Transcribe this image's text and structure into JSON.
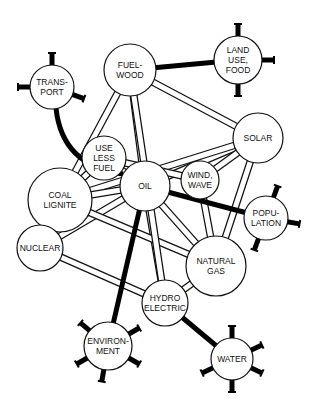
{
  "diagram": {
    "type": "energy-resource network",
    "nodes": [
      {
        "id": "fuelwood",
        "lines": [
          "FUEL-",
          "WOOD"
        ],
        "cx": 130,
        "cy": 70,
        "r": 26
      },
      {
        "id": "landuse",
        "lines": [
          "LAND",
          "USE,",
          "FOOD"
        ],
        "cx": 238,
        "cy": 60,
        "r": 24,
        "external": true
      },
      {
        "id": "transport",
        "lines": [
          "TRANS-",
          "PORT"
        ],
        "cx": 52,
        "cy": 87,
        "r": 22,
        "external": true
      },
      {
        "id": "uselessfuel",
        "lines": [
          "USE",
          "LESS",
          "FUEL"
        ],
        "cx": 104,
        "cy": 158,
        "r": 22
      },
      {
        "id": "solar",
        "lines": [
          "SOLAR"
        ],
        "cx": 258,
        "cy": 138,
        "r": 25
      },
      {
        "id": "oil",
        "lines": [
          "OIL"
        ],
        "cx": 145,
        "cy": 186,
        "r": 25
      },
      {
        "id": "windwave",
        "lines": [
          "WIND,",
          "WAVE"
        ],
        "cx": 200,
        "cy": 180,
        "r": 19
      },
      {
        "id": "coal",
        "lines": [
          "COAL",
          "LIGNITE"
        ],
        "cx": 60,
        "cy": 200,
        "r": 32
      },
      {
        "id": "population",
        "lines": [
          "POPU-",
          "LATION"
        ],
        "cx": 266,
        "cy": 218,
        "r": 22,
        "external": true
      },
      {
        "id": "nuclear",
        "lines": [
          "NUCLEAR"
        ],
        "cx": 40,
        "cy": 248,
        "r": 23
      },
      {
        "id": "naturalgas",
        "lines": [
          "NATURAL",
          "GAS"
        ],
        "cx": 216,
        "cy": 266,
        "r": 30
      },
      {
        "id": "hydro",
        "lines": [
          "HYDRO",
          "ELECTRIC"
        ],
        "cx": 165,
        "cy": 303,
        "r": 23
      },
      {
        "id": "environment",
        "lines": [
          "ENVIRON-",
          "MENT"
        ],
        "cx": 108,
        "cy": 346,
        "r": 24,
        "external": true
      },
      {
        "id": "water",
        "lines": [
          "WATER"
        ],
        "cx": 232,
        "cy": 359,
        "r": 21,
        "external": true
      }
    ],
    "pipes": [
      [
        "fuelwood",
        "coal"
      ],
      [
        "fuelwood",
        "oil"
      ],
      [
        "fuelwood",
        "solar"
      ],
      [
        "uselessfuel",
        "oil"
      ],
      [
        "solar",
        "oil"
      ],
      [
        "solar",
        "windwave"
      ],
      [
        "solar",
        "naturalgas"
      ],
      [
        "solar",
        "coal"
      ],
      [
        "oil",
        "coal"
      ],
      [
        "oil",
        "naturalgas"
      ],
      [
        "oil",
        "hydro"
      ],
      [
        "oil",
        "nuclear"
      ],
      [
        "windwave",
        "naturalgas"
      ],
      [
        "coal",
        "naturalgas"
      ],
      [
        "coal",
        "uselessfuel"
      ],
      [
        "nuclear",
        "hydro"
      ],
      [
        "nuclear",
        "coal"
      ],
      [
        "naturalgas",
        "hydro"
      ],
      [
        "fuelwood",
        "hydro"
      ],
      [
        "uselessfuel",
        "windwave"
      ]
    ],
    "links": [
      [
        "fuelwood",
        "landuse"
      ],
      [
        "transport",
        "oil"
      ],
      [
        "oil",
        "population"
      ],
      [
        "oil",
        "environment"
      ],
      [
        "hydro",
        "water"
      ]
    ]
  }
}
